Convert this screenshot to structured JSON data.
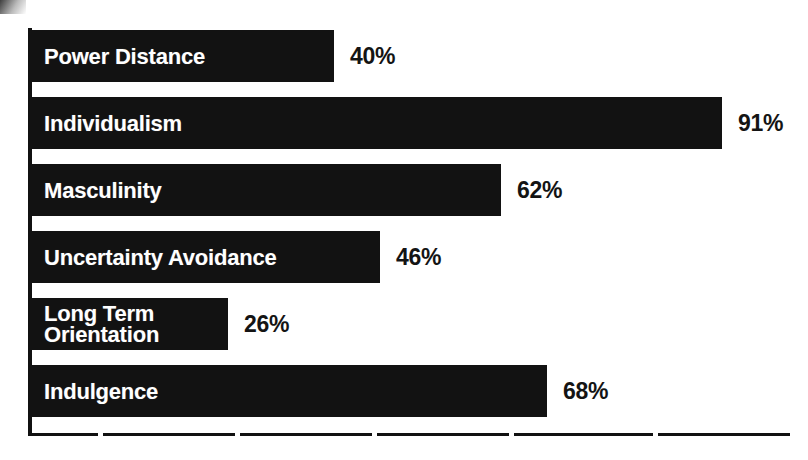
{
  "chart_data": {
    "type": "bar",
    "orientation": "horizontal",
    "title": "",
    "subtitle": "",
    "xlabel": "",
    "ylabel": "",
    "xlim": [
      0,
      100
    ],
    "grid": false,
    "legend": null,
    "value_suffix": "%",
    "categories": [
      "Power Distance",
      "Individualism",
      "Masculinity",
      "Uncertainty Avoidance",
      "Long Term Orientation",
      "Indulgence"
    ],
    "values": [
      40,
      91,
      62,
      46,
      26,
      68
    ],
    "value_labels": [
      "40%",
      "91%",
      "62%",
      "46%",
      "26%",
      "68%"
    ],
    "bar_color": "#121212",
    "label_color": "#ffffff",
    "value_color": "#141414",
    "background_color": "#ffffff",
    "axis_color": "#111111"
  },
  "bars": [
    {
      "label": "Power Distance",
      "label_lines": [
        "Power Distance"
      ],
      "value": 40,
      "value_label": "40%"
    },
    {
      "label": "Individualism",
      "label_lines": [
        "Individualism"
      ],
      "value": 91,
      "value_label": "91%"
    },
    {
      "label": "Masculinity",
      "label_lines": [
        "Masculinity"
      ],
      "value": 62,
      "value_label": "62%"
    },
    {
      "label": "Uncertainty Avoidance",
      "label_lines": [
        "Uncertainty Avoidance"
      ],
      "value": 46,
      "value_label": "46%"
    },
    {
      "label": "Long Term Orientation",
      "label_lines": [
        "Long Term",
        "Orientation"
      ],
      "value": 26,
      "value_label": "26%"
    },
    {
      "label": "Indulgence",
      "label_lines": [
        "Indulgence"
      ],
      "value": 68,
      "value_label": "68%"
    }
  ],
  "axis": {
    "x_tick_values": [
      9,
      27,
      45,
      63,
      82
    ]
  }
}
